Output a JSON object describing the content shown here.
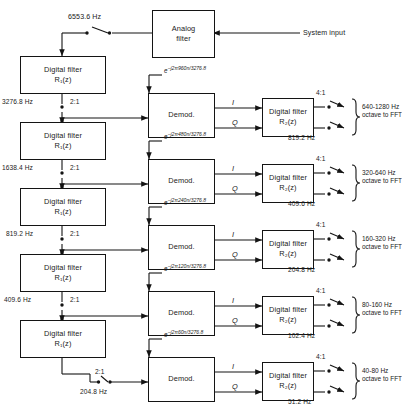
{
  "diagram": {
    "system_input_label": "System input",
    "analog_filter": {
      "line1": "Analog",
      "line2": "filter"
    },
    "top_rate": "6553.6 Hz",
    "demod_label": "Demod.",
    "i_label": "I",
    "q_label": "Q",
    "decim_2to1": "2:1",
    "decim_4to1": "4:1",
    "r1_line1": "Digital filter",
    "r1_line2": "R₁(z)",
    "r2_line1": "Digital filter",
    "r2_line2": "R₂(z)",
    "stages": [
      {
        "input_rate": "3276.8 Hz",
        "exponent_num": "960",
        "exponent_den": "3276.8",
        "output_rate": "819.2 Hz",
        "band": "640-1280 Hz",
        "band_dest": "octave to FFT"
      },
      {
        "input_rate": "1638.4 Hz",
        "exponent_num": "480",
        "exponent_den": "3276.8",
        "output_rate": "409.6 Hz",
        "band": "320-640 Hz",
        "band_dest": "octave to FFT"
      },
      {
        "input_rate": "819.2 Hz",
        "exponent_num": "240",
        "exponent_den": "3276.8",
        "output_rate": "204.8 Hz",
        "band": "160-320 Hz",
        "band_dest": "octave to FFT"
      },
      {
        "input_rate": "409.6 Hz",
        "exponent_num": "120",
        "exponent_den": "3276.8",
        "output_rate": "102.4 Hz",
        "band": "80-160 Hz",
        "band_dest": "octave to FFT"
      },
      {
        "input_rate": "204.8 Hz",
        "exponent_num": "60",
        "exponent_den": "3276.8",
        "output_rate": "51.2 Hz",
        "band": "40-80 Hz",
        "band_dest": "octave to FFT"
      }
    ],
    "colors": {
      "ink": "#141414",
      "paper": "#ffffff"
    }
  }
}
